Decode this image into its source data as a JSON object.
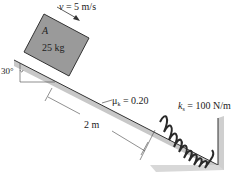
{
  "diagram": {
    "type": "mechanics-incline-spring",
    "block": {
      "label": "A",
      "mass": "25 kg"
    },
    "velocity": {
      "symbol": "v",
      "value": "= 5 m/s"
    },
    "angle": "30°",
    "friction": {
      "symbol": "μ",
      "subscript": "k",
      "value": "= 0.20"
    },
    "distance": "2 m",
    "spring": {
      "symbol": "k",
      "subscript": "s",
      "value": "= 100 N/m"
    },
    "colors": {
      "block": "#9a9a9a",
      "incline_shadow": "#b8b8b8",
      "line": "#333333",
      "spring": "#2a2a2a"
    }
  }
}
